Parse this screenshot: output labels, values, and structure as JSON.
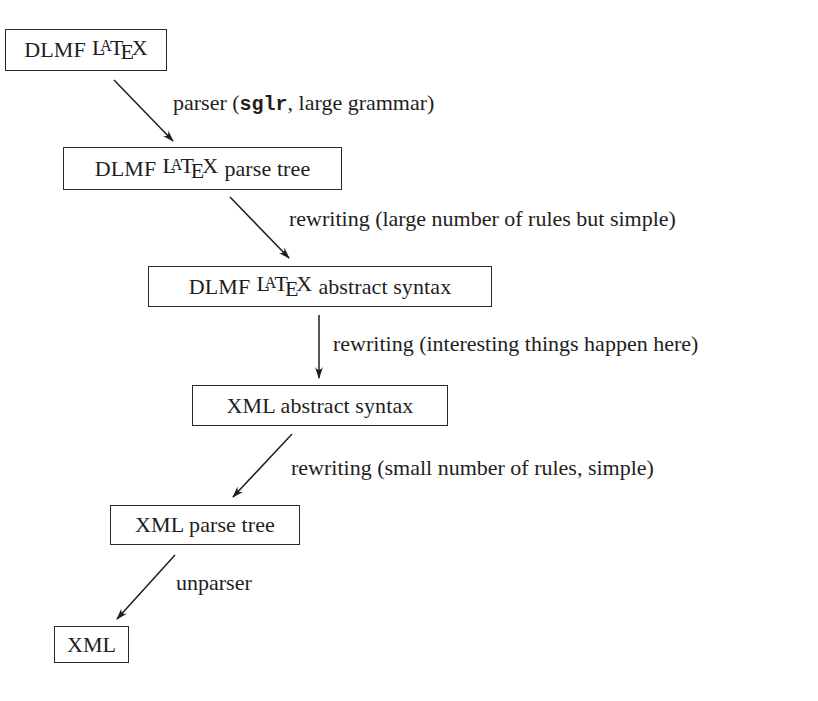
{
  "diagram": {
    "type": "pipeline-flow",
    "nodes": [
      {
        "id": "n1",
        "prefix": "DLMF",
        "latex_logo": {
          "L": "L",
          "A": "A",
          "T": "T",
          "E": "E",
          "X": "X"
        },
        "suffix": "",
        "full_text": "DLMF LaTeX"
      },
      {
        "id": "n2",
        "prefix": "DLMF",
        "latex_logo": {
          "L": "L",
          "A": "A",
          "T": "T",
          "E": "E",
          "X": "X"
        },
        "suffix": "parse tree",
        "full_text": "DLMF LaTeX parse tree"
      },
      {
        "id": "n3",
        "prefix": "DLMF",
        "latex_logo": {
          "L": "L",
          "A": "A",
          "T": "T",
          "E": "E",
          "X": "X"
        },
        "suffix": "abstract syntax",
        "full_text": "DLMF LaTeX abstract syntax"
      },
      {
        "id": "n4",
        "text": "XML abstract syntax"
      },
      {
        "id": "n5",
        "text": "XML parse tree"
      },
      {
        "id": "n6",
        "text": "XML"
      }
    ],
    "edges": [
      {
        "from": "n1",
        "to": "n2",
        "label_before": "parser (",
        "label_code": "sglr",
        "label_after": ", large grammar)",
        "full_label": "parser (sglr, large grammar)"
      },
      {
        "from": "n2",
        "to": "n3",
        "label": "rewriting (large number of rules but simple)"
      },
      {
        "from": "n3",
        "to": "n4",
        "label": "rewriting (interesting things happen here)"
      },
      {
        "from": "n4",
        "to": "n5",
        "label": "rewriting (small number of rules, simple)"
      },
      {
        "from": "n5",
        "to": "n6",
        "label": "unparser"
      }
    ],
    "colors": {
      "ink": "#1e1e1e",
      "background": "#ffffff"
    }
  }
}
